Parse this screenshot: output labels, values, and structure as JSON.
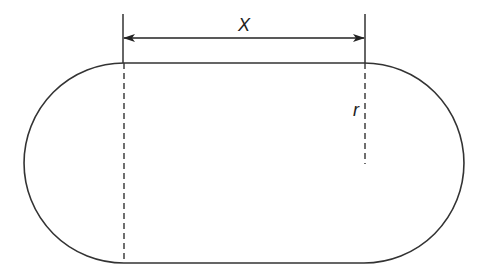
{
  "diagram": {
    "labels": {
      "length": "X",
      "radius": "r"
    },
    "colors": {
      "stroke": "#333333",
      "background": "#ffffff"
    }
  }
}
